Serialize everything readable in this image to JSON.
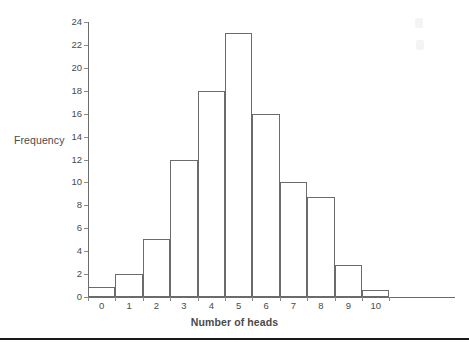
{
  "chart_data": {
    "type": "bar",
    "title": "",
    "subtitle": "",
    "xlabel": "Number of heads",
    "ylabel": "Frequency",
    "categories": [
      "0",
      "1",
      "2",
      "3",
      "4",
      "5",
      "6",
      "7",
      "8",
      "9",
      "10"
    ],
    "values": [
      0.9,
      2,
      5.1,
      12,
      18,
      23,
      16,
      10,
      8.7,
      2.8,
      0.6
    ],
    "ylim": [
      0,
      24
    ],
    "y_ticks": [
      0,
      2,
      4,
      6,
      8,
      10,
      12,
      14,
      16,
      18,
      20,
      22,
      24
    ],
    "x_ticks": [
      "0",
      "1",
      "2",
      "3",
      "4",
      "5",
      "6",
      "7",
      "8",
      "9",
      "10"
    ],
    "grid": false,
    "legend": "none",
    "bar_style": "outlined-adjacent-histogram",
    "bar_fill_color": "#ffffff",
    "bar_border_color": "#6b6b6b",
    "axis_color": "#6b6b6b"
  },
  "figure": {
    "y_axis_title": "Frequency",
    "x_axis_title": "Number of heads"
  }
}
